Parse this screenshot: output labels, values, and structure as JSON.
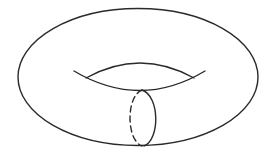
{
  "diagram": {
    "stroke_color": "#2a2a2a",
    "background": "#ffffff",
    "elements": [
      {
        "name": "outer-boundary",
        "type": "ellipse",
        "cx": 138,
        "cy": 77,
        "rx": 120,
        "ry": 69
      },
      {
        "name": "hole-upper-arc",
        "type": "arc"
      },
      {
        "name": "hole-lower-arc",
        "type": "arc"
      },
      {
        "name": "meridian-circle-front",
        "type": "arc",
        "style": "solid"
      },
      {
        "name": "meridian-circle-back",
        "type": "arc",
        "style": "dashed"
      }
    ]
  }
}
